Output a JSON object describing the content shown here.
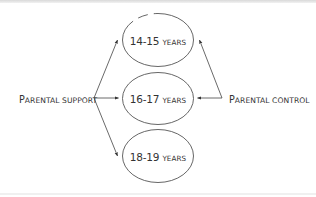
{
  "diagram": {
    "type": "influence-diagram",
    "colors": {
      "stroke": "#444444",
      "text": "#333333",
      "background": "#ffffff"
    },
    "sources": [
      {
        "id": "support",
        "label_cap": "P",
        "label_rest": "arental support",
        "label": "Parental support",
        "side": "left"
      },
      {
        "id": "control",
        "label_cap": "P",
        "label_rest": "arental control",
        "label": "Parental control",
        "side": "right"
      }
    ],
    "nodes": [
      {
        "id": "age-14-15",
        "range": "14-15",
        "unit": "years",
        "label": "14-15 years"
      },
      {
        "id": "age-16-17",
        "range": "16-17",
        "unit": "years",
        "label": "16-17 years"
      },
      {
        "id": "age-18-19",
        "range": "18-19",
        "unit": "years",
        "label": "18-19 years"
      }
    ],
    "edges": [
      {
        "from": "support",
        "to": "age-14-15"
      },
      {
        "from": "support",
        "to": "age-16-17"
      },
      {
        "from": "support",
        "to": "age-18-19"
      },
      {
        "from": "control",
        "to": "age-14-15"
      },
      {
        "from": "control",
        "to": "age-16-17"
      }
    ]
  }
}
